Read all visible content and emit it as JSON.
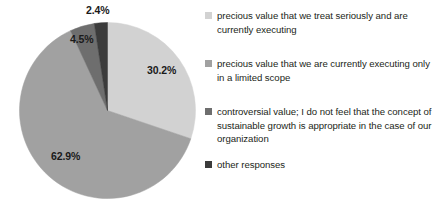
{
  "chart_data": {
    "type": "pie",
    "title": "",
    "labels": [
      "precious value that we treat seriously and are currently executing",
      "precious value that we are currently executing only in a limited scope",
      "controversial value; I do not feel that the concept of sustainable growth is appropriate in the case of our organization",
      "other responses"
    ],
    "values": [
      30.2,
      62.9,
      4.5,
      2.4
    ],
    "value_labels": [
      "30.2%",
      "62.9%",
      "4.5%",
      "2.4%"
    ],
    "colors": [
      "#d2d2d2",
      "#a1a1a1",
      "#6e6e6e",
      "#3b3b3b"
    ],
    "legend_position": "right",
    "start_angle_deg": 0,
    "direction": "clockwise",
    "units": "percent"
  },
  "pie": {
    "slices": [
      {
        "name": "precious-value-seriously",
        "percent_label": "30.2%",
        "color": "#d2d2d2"
      },
      {
        "name": "precious-value-limited-scope",
        "percent_label": "62.9%",
        "color": "#a1a1a1"
      },
      {
        "name": "controversial-value",
        "percent_label": "4.5%",
        "color": "#6e6e6e"
      },
      {
        "name": "other-responses",
        "percent_label": "2.4%",
        "color": "#3b3b3b"
      }
    ]
  },
  "legend": {
    "items": [
      {
        "label": "precious value that we treat seriously and are currently executing",
        "color": "#d2d2d2"
      },
      {
        "label": "precious value that we are currently executing only in a limited scope",
        "color": "#a1a1a1"
      },
      {
        "label": "controversial value; I do not feel that the concept of sustainable growth is appropriate in the case of our organization",
        "color": "#6e6e6e"
      },
      {
        "label": "other responses",
        "color": "#3b3b3b"
      }
    ]
  }
}
